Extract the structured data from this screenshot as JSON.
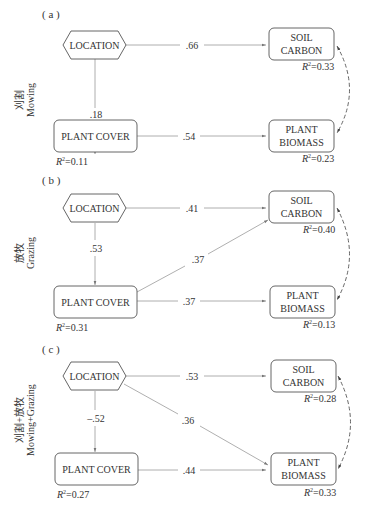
{
  "panels": [
    {
      "label": "( a )",
      "side_cn": "刈割",
      "side_en": "Mowing",
      "location": "LOCATION",
      "plant_cover": "PLANT COVER",
      "soil_carbon_1": "SOIL",
      "soil_carbon_2": "CARBON",
      "plant_biomass_1": "PLANT",
      "plant_biomass_2": "BIOMASS",
      "coef_loc_soil": ".66",
      "coef_loc_cover": ".18",
      "coef_cover_biomass": ".54",
      "r2_cover": "=0.11",
      "r2_soil": "=0.33",
      "r2_biomass": "=0.23"
    },
    {
      "label": "( b )",
      "side_cn": "放牧",
      "side_en": "Grazing",
      "location": "LOCATION",
      "plant_cover": "PLANT COVER",
      "soil_carbon_1": "SOIL",
      "soil_carbon_2": "CARBON",
      "plant_biomass_1": "PLANT",
      "plant_biomass_2": "BIOMASS",
      "coef_loc_soil": ".41",
      "coef_loc_cover": ".53",
      "coef_cover_soil": ".37",
      "coef_cover_biomass": ".37",
      "r2_cover": "=0.31",
      "r2_soil": "=0.40",
      "r2_biomass": "=0.13"
    },
    {
      "label": "( c )",
      "side_cn": "刈割+放牧",
      "side_en": "Mowing+Grazing",
      "location": "LOCATION",
      "plant_cover": "PLANT COVER",
      "soil_carbon_1": "SOIL",
      "soil_carbon_2": "CARBON",
      "plant_biomass_1": "PLANT",
      "plant_biomass_2": "BIOMASS",
      "coef_loc_soil": ".53",
      "coef_loc_cover": "–.52",
      "coef_loc_biomass": ".36",
      "coef_cover_biomass": ".44",
      "r2_cover": "=0.27",
      "r2_soil": "=0.28",
      "r2_biomass": "=0.33"
    }
  ],
  "r2_symbol": "R",
  "r2_sup": "2"
}
